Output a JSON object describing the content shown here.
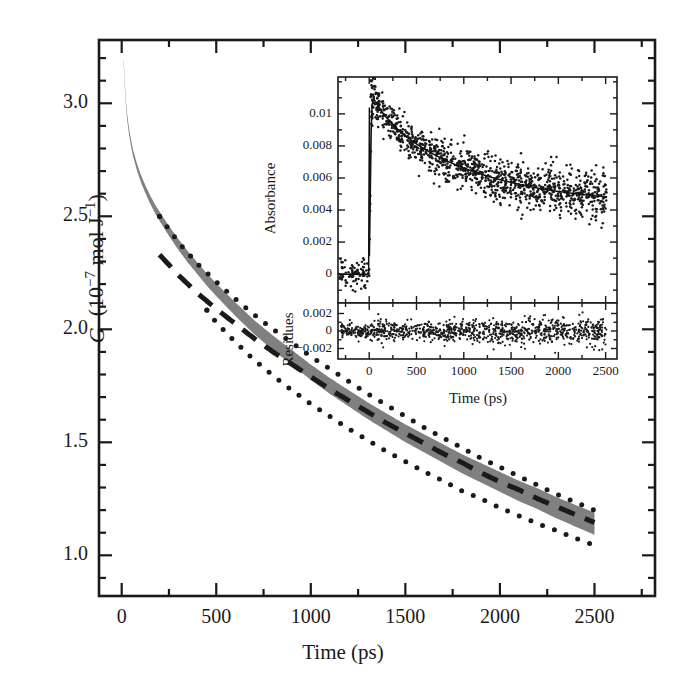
{
  "figure": {
    "background": "#ffffff",
    "ink": "#1a1a1a",
    "band_color": "#808080"
  },
  "main_axes": {
    "xlabel": "Time (ps)",
    "ylabel_symbol": "G",
    "ylabel_unit": "(10−7 mol J−1)",
    "ylabel_full": "G (10−7 mol J−1)",
    "x_ticks": [
      "0",
      "500",
      "1000",
      "1500",
      "2000",
      "2500"
    ],
    "y_ticks": [
      "1.0",
      "1.5",
      "2.0",
      "2.5",
      "3.0"
    ]
  },
  "inset_axes": {
    "ylabel_top": "Absorbance",
    "ylabel_bottom": "Residues",
    "xlabel": "Time (ps)",
    "x_ticks": [
      "0",
      "500",
      "1000",
      "1500",
      "2000",
      "2500"
    ],
    "y_ticks_top": [
      "0",
      "0.002",
      "0.004",
      "0.006",
      "0.008",
      "0.01"
    ],
    "y_ticks_bottom": [
      "−0.002",
      "0",
      "0.002"
    ]
  },
  "chart_data": {
    "type": "line",
    "title": "",
    "xlabel": "Time (ps)",
    "ylabel": "G (10^-7 mol J^-1)",
    "xlim": [
      -120,
      2820
    ],
    "ylim": [
      0.82,
      3.28
    ],
    "grid": false,
    "legend": "none",
    "series": [
      {
        "name": "G best fit (central line of grey band)",
        "style": "solid-thick-grey-band",
        "color": "#808080",
        "x": [
          10,
          20,
          30,
          40,
          50,
          60,
          80,
          100,
          125,
          150,
          175,
          200,
          250,
          300,
          350,
          400,
          450,
          500,
          600,
          700,
          800,
          900,
          1000,
          1100,
          1200,
          1300,
          1400,
          1500,
          1600,
          1700,
          1800,
          1900,
          2000,
          2100,
          2200,
          2300,
          2400,
          2500
        ],
        "y": [
          3.19,
          3.02,
          2.93,
          2.87,
          2.82,
          2.78,
          2.72,
          2.67,
          2.62,
          2.575,
          2.535,
          2.5,
          2.435,
          2.375,
          2.32,
          2.27,
          2.22,
          2.175,
          2.09,
          2.01,
          1.94,
          1.875,
          1.81,
          1.75,
          1.695,
          1.64,
          1.59,
          1.54,
          1.495,
          1.45,
          1.405,
          1.365,
          1.325,
          1.285,
          1.25,
          1.21,
          1.175,
          1.14
        ],
        "band_halfwidth": [
          0.012,
          0.012,
          0.013,
          0.013,
          0.014,
          0.014,
          0.015,
          0.016,
          0.017,
          0.018,
          0.019,
          0.02,
          0.022,
          0.024,
          0.025,
          0.026,
          0.027,
          0.028,
          0.03,
          0.031,
          0.032,
          0.033,
          0.034,
          0.035,
          0.036,
          0.037,
          0.038,
          0.039,
          0.04,
          0.041,
          0.042,
          0.043,
          0.044,
          0.045,
          0.046,
          0.047,
          0.048,
          0.049
        ]
      },
      {
        "name": "Alternative model (dashed)",
        "style": "dashed",
        "color": "#1a1a1a",
        "x": [
          200,
          300,
          400,
          500,
          600,
          700,
          800,
          900,
          1000,
          1100,
          1200,
          1300,
          1400,
          1500,
          1600,
          1700,
          1800,
          1900,
          2000,
          2100,
          2200,
          2300,
          2400,
          2500
        ],
        "y": [
          2.33,
          2.24,
          2.16,
          2.09,
          2.025,
          1.96,
          1.9,
          1.845,
          1.79,
          1.735,
          1.685,
          1.635,
          1.585,
          1.54,
          1.495,
          1.45,
          1.41,
          1.365,
          1.325,
          1.29,
          1.25,
          1.215,
          1.18,
          1.145
        ],
        "dash": "18 12"
      },
      {
        "name": "Upper confidence bound (dotted)",
        "style": "dotted",
        "color": "#1a1a1a",
        "x": [
          200,
          300,
          400,
          500,
          600,
          700,
          800,
          900,
          1000,
          1100,
          1200,
          1300,
          1400,
          1500,
          1600,
          1700,
          1800,
          1900,
          2000,
          2100,
          2200,
          2300,
          2400,
          2500
        ],
        "y": [
          2.5,
          2.385,
          2.29,
          2.21,
          2.135,
          2.065,
          2.0,
          1.94,
          1.88,
          1.825,
          1.77,
          1.715,
          1.665,
          1.615,
          1.565,
          1.52,
          1.475,
          1.43,
          1.39,
          1.35,
          1.31,
          1.27,
          1.235,
          1.2
        ]
      },
      {
        "name": "Lower confidence bound (dotted)",
        "style": "dotted",
        "color": "#1a1a1a",
        "x": [
          450,
          500,
          600,
          700,
          800,
          900,
          1000,
          1100,
          1200,
          1300,
          1400,
          1500,
          1600,
          1700,
          1800,
          1900,
          2000,
          2100,
          2200,
          2300,
          2400,
          2500
        ],
        "y": [
          2.085,
          2.03,
          1.945,
          1.865,
          1.795,
          1.73,
          1.67,
          1.615,
          1.56,
          1.51,
          1.46,
          1.415,
          1.37,
          1.33,
          1.285,
          1.25,
          1.21,
          1.175,
          1.14,
          1.11,
          1.075,
          1.045
        ]
      }
    ]
  },
  "inset_chart_data": {
    "type": "scatter",
    "title": "",
    "panels": [
      {
        "name": "absorbance-panel",
        "ylabel": "Absorbance",
        "xlim": [
          -330,
          2620
        ],
        "ylim": [
          -0.0018,
          0.0123
        ],
        "y_ticks": [
          0,
          0.002,
          0.004,
          0.006,
          0.008,
          0.01
        ],
        "fit_curve": {
          "name": "Exponential fit",
          "x": [
            0,
            25,
            50,
            75,
            100,
            150,
            200,
            300,
            400,
            500,
            600,
            700,
            800,
            900,
            1000,
            1100,
            1200,
            1300,
            1400,
            1500,
            1600,
            1700,
            1800,
            1900,
            2000,
            2100,
            2200,
            2300,
            2400,
            2500
          ],
          "y": [
            0.0003,
            0.0105,
            0.0109,
            0.0107,
            0.01045,
            0.01,
            0.00965,
            0.00905,
            0.00855,
            0.00812,
            0.00775,
            0.00742,
            0.00712,
            0.00686,
            0.00662,
            0.0064,
            0.00621,
            0.00603,
            0.00587,
            0.00572,
            0.00559,
            0.00546,
            0.00535,
            0.00525,
            0.00516,
            0.00508,
            0.005,
            0.00494,
            0.00488,
            0.00483
          ]
        },
        "scatter_description": "Dense noisy data points scattered about the fit, noise sigma ~0.0006, baseline near 0 before t=0, sharp rise at t=0 to ~0.011, monotonic decay to ~0.005 at 2500 ps"
      },
      {
        "name": "residues-panel",
        "ylabel": "Residues",
        "xlim": [
          -330,
          2620
        ],
        "ylim": [
          -0.0032,
          0.0032
        ],
        "y_ticks": [
          -0.002,
          0,
          0.002
        ],
        "scatter_description": "Residuals scattered about zero, sigma ~0.0006, no trend"
      }
    ],
    "xlabel": "Time (ps)",
    "x_ticks": [
      0,
      500,
      1000,
      1500,
      2000,
      2500
    ]
  }
}
